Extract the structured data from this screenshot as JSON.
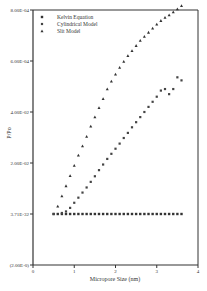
{
  "chart_data": {
    "type": "scatter",
    "title": "",
    "xlabel": "Micropore Size (nm)",
    "ylabel": "P/Po",
    "xlim": [
      0,
      4
    ],
    "x_ticks": [
      "0",
      "1",
      "2",
      "3",
      "4"
    ],
    "y_ticks": [
      "(2.00E-0)",
      "3.71E-32",
      "2.00E-02",
      "4.00E-02",
      "6.00E-04",
      "8.00E-04"
    ],
    "grid": false,
    "legend_position": "top-left",
    "series": [
      {
        "name": "Kelvin Equation",
        "marker": "square",
        "x": [
          0.5,
          0.6,
          0.7,
          0.8,
          0.9,
          1.0,
          1.1,
          1.2,
          1.3,
          1.4,
          1.5,
          1.6,
          1.7,
          1.8,
          1.9,
          2.0,
          2.1,
          2.2,
          2.3,
          2.4,
          2.5,
          2.6,
          2.7,
          2.8,
          2.9,
          3.0,
          3.1,
          3.2,
          3.3,
          3.4,
          3.5,
          3.6
        ],
        "y_level": [
          1,
          1,
          1,
          1,
          1,
          1,
          1,
          1,
          1,
          1,
          1,
          1,
          1,
          1,
          1,
          1,
          1,
          1,
          1,
          1,
          1,
          1,
          1,
          1,
          1,
          1,
          1,
          1,
          1,
          1,
          1,
          1
        ]
      },
      {
        "name": "Cylindrical Model",
        "marker": "circle",
        "x": [
          0.5,
          0.7,
          0.8,
          0.9,
          1.0,
          1.1,
          1.2,
          1.3,
          1.4,
          1.5,
          1.6,
          1.7,
          1.8,
          1.9,
          2.0,
          2.1,
          2.2,
          2.3,
          2.4,
          2.5,
          2.6,
          2.7,
          2.8,
          2.9,
          3.0,
          3.1,
          3.2,
          3.3,
          3.4,
          3.5,
          3.6
        ],
        "y_level": [
          1.0,
          1.02,
          1.05,
          1.12,
          1.22,
          1.32,
          1.42,
          1.52,
          1.63,
          1.74,
          1.86,
          1.97,
          2.08,
          2.18,
          2.28,
          2.38,
          2.49,
          2.59,
          2.7,
          2.8,
          2.9,
          3.0,
          3.1,
          3.2,
          3.3,
          3.42,
          3.45,
          3.35,
          3.45,
          3.68,
          3.62
        ]
      },
      {
        "name": "Slit Model",
        "marker": "triangle",
        "x": [
          0.6,
          0.7,
          0.8,
          0.9,
          1.0,
          1.1,
          1.2,
          1.3,
          1.4,
          1.5,
          1.6,
          1.7,
          1.8,
          1.9,
          2.0,
          2.1,
          2.2,
          2.3,
          2.4,
          2.5,
          2.6,
          2.7,
          2.8,
          2.9,
          3.0,
          3.1,
          3.2,
          3.3,
          3.4,
          3.5,
          3.6
        ],
        "y_level": [
          1.15,
          1.35,
          1.55,
          1.75,
          1.95,
          2.15,
          2.33,
          2.52,
          2.72,
          2.9,
          3.08,
          3.26,
          3.45,
          3.6,
          3.74,
          3.87,
          3.99,
          4.1,
          4.2,
          4.3,
          4.4,
          4.48,
          4.56,
          4.64,
          4.72,
          4.79,
          4.85,
          4.9,
          4.96,
          5.02,
          5.08
        ]
      }
    ]
  },
  "legend": {
    "items": [
      "Kelvin Equation",
      "Cylindrical Model",
      "Slit Model"
    ]
  }
}
